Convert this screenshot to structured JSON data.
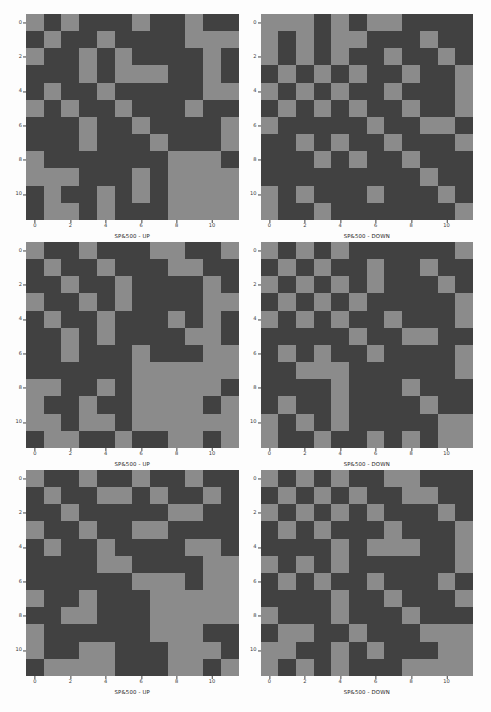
{
  "figure": {
    "columns": 2,
    "rows": 3,
    "background_color": "#fdfdfd",
    "on_color": "#8b8b8b",
    "off_color": "#414141",
    "grid_size": 12
  },
  "axes": {
    "x_ticks": [
      "0",
      "2",
      "4",
      "6",
      "8",
      "10"
    ],
    "y_ticks": [
      "0",
      "2",
      "4",
      "6",
      "8",
      "10"
    ],
    "tick_indices": [
      0,
      2,
      4,
      6,
      8,
      10
    ]
  },
  "chart_data": [
    {
      "type": "heatmap",
      "title": "SP&500 - UP",
      "xlabel": "",
      "ylabel": "",
      "xlim": [
        0,
        12
      ],
      "ylim": [
        0,
        12
      ],
      "grid": false,
      "legend": "none",
      "colorscale": [
        "#414141",
        "#8b8b8b"
      ],
      "x": [
        0,
        1,
        2,
        3,
        4,
        5,
        6,
        7,
        8,
        9,
        10,
        11
      ],
      "y": [
        0,
        1,
        2,
        3,
        4,
        5,
        6,
        7,
        8,
        9,
        10,
        11
      ],
      "values": [
        [
          1,
          0,
          1,
          0,
          0,
          0,
          1,
          0,
          0,
          1,
          0,
          0
        ],
        [
          0,
          1,
          0,
          0,
          1,
          0,
          0,
          0,
          0,
          1,
          1,
          1
        ],
        [
          1,
          0,
          0,
          1,
          0,
          1,
          0,
          0,
          0,
          0,
          1,
          0
        ],
        [
          0,
          0,
          0,
          1,
          0,
          1,
          1,
          1,
          0,
          0,
          1,
          0
        ],
        [
          0,
          1,
          0,
          0,
          1,
          0,
          0,
          0,
          0,
          0,
          1,
          1
        ],
        [
          1,
          0,
          1,
          0,
          0,
          1,
          0,
          0,
          0,
          1,
          0,
          0
        ],
        [
          0,
          0,
          0,
          1,
          0,
          0,
          1,
          0,
          0,
          0,
          0,
          1
        ],
        [
          0,
          0,
          0,
          1,
          0,
          0,
          0,
          1,
          0,
          0,
          0,
          1
        ],
        [
          1,
          0,
          0,
          0,
          0,
          0,
          0,
          0,
          1,
          1,
          1,
          0
        ],
        [
          1,
          1,
          1,
          0,
          0,
          0,
          1,
          0,
          1,
          1,
          1,
          1
        ],
        [
          0,
          1,
          0,
          0,
          1,
          0,
          1,
          0,
          1,
          1,
          1,
          1
        ],
        [
          0,
          1,
          1,
          0,
          1,
          0,
          0,
          0,
          1,
          1,
          1,
          1
        ]
      ]
    },
    {
      "type": "heatmap",
      "title": "SP&500 - DOWN",
      "xlabel": "",
      "ylabel": "",
      "xlim": [
        0,
        12
      ],
      "ylim": [
        0,
        12
      ],
      "grid": false,
      "legend": "none",
      "colorscale": [
        "#414141",
        "#8b8b8b"
      ],
      "x": [
        0,
        1,
        2,
        3,
        4,
        5,
        6,
        7,
        8,
        9,
        10,
        11
      ],
      "y": [
        0,
        1,
        2,
        3,
        4,
        5,
        6,
        7,
        8,
        9,
        10,
        11
      ],
      "values": [
        [
          1,
          1,
          1,
          0,
          1,
          0,
          1,
          1,
          0,
          0,
          0,
          0
        ],
        [
          1,
          0,
          1,
          0,
          1,
          1,
          0,
          0,
          0,
          1,
          0,
          0
        ],
        [
          1,
          0,
          1,
          0,
          1,
          0,
          0,
          1,
          0,
          0,
          1,
          0
        ],
        [
          0,
          1,
          0,
          1,
          0,
          1,
          0,
          0,
          1,
          0,
          0,
          1
        ],
        [
          1,
          0,
          1,
          0,
          1,
          0,
          0,
          1,
          0,
          0,
          0,
          1
        ],
        [
          0,
          1,
          0,
          1,
          0,
          1,
          0,
          0,
          1,
          0,
          0,
          1
        ],
        [
          1,
          0,
          0,
          0,
          0,
          0,
          1,
          0,
          0,
          1,
          1,
          0
        ],
        [
          0,
          0,
          1,
          0,
          1,
          0,
          0,
          1,
          0,
          0,
          0,
          1
        ],
        [
          0,
          0,
          0,
          1,
          0,
          1,
          0,
          0,
          1,
          0,
          0,
          0
        ],
        [
          0,
          0,
          0,
          0,
          0,
          0,
          0,
          0,
          0,
          1,
          0,
          0
        ],
        [
          1,
          0,
          1,
          0,
          0,
          0,
          1,
          0,
          0,
          0,
          1,
          0
        ],
        [
          1,
          0,
          0,
          1,
          0,
          0,
          0,
          0,
          0,
          0,
          0,
          1
        ]
      ]
    },
    {
      "type": "heatmap",
      "title": "SP&500 - UP",
      "xlabel": "",
      "ylabel": "",
      "xlim": [
        0,
        12
      ],
      "ylim": [
        0,
        12
      ],
      "grid": false,
      "legend": "none",
      "colorscale": [
        "#414141",
        "#8b8b8b"
      ],
      "x": [
        0,
        1,
        2,
        3,
        4,
        5,
        6,
        7,
        8,
        9,
        10,
        11
      ],
      "y": [
        0,
        1,
        2,
        3,
        4,
        5,
        6,
        7,
        8,
        9,
        10,
        11
      ],
      "values": [
        [
          1,
          0,
          0,
          1,
          0,
          0,
          0,
          1,
          1,
          0,
          0,
          1
        ],
        [
          0,
          1,
          0,
          0,
          1,
          0,
          0,
          0,
          1,
          1,
          0,
          0
        ],
        [
          0,
          0,
          1,
          0,
          0,
          1,
          0,
          0,
          0,
          0,
          1,
          0
        ],
        [
          1,
          0,
          0,
          1,
          0,
          1,
          0,
          0,
          0,
          0,
          1,
          1
        ],
        [
          0,
          1,
          0,
          0,
          1,
          0,
          0,
          0,
          1,
          0,
          1,
          0
        ],
        [
          0,
          0,
          1,
          0,
          1,
          0,
          0,
          0,
          0,
          1,
          1,
          0
        ],
        [
          0,
          0,
          1,
          0,
          0,
          0,
          1,
          0,
          0,
          0,
          1,
          1
        ],
        [
          0,
          0,
          0,
          0,
          0,
          0,
          1,
          1,
          1,
          1,
          1,
          1
        ],
        [
          1,
          1,
          0,
          0,
          1,
          0,
          1,
          1,
          1,
          1,
          1,
          0
        ],
        [
          1,
          0,
          0,
          1,
          0,
          0,
          1,
          1,
          1,
          1,
          0,
          1
        ],
        [
          1,
          1,
          0,
          1,
          1,
          0,
          1,
          1,
          1,
          1,
          1,
          1
        ],
        [
          0,
          1,
          1,
          0,
          0,
          1,
          0,
          0,
          1,
          1,
          0,
          1
        ]
      ]
    },
    {
      "type": "heatmap",
      "title": "SP&500 - DOWN",
      "xlabel": "",
      "ylabel": "",
      "xlim": [
        0,
        12
      ],
      "ylim": [
        0,
        12
      ],
      "grid": false,
      "legend": "none",
      "colorscale": [
        "#414141",
        "#8b8b8b"
      ],
      "x": [
        0,
        1,
        2,
        3,
        4,
        5,
        6,
        7,
        8,
        9,
        10,
        11
      ],
      "y": [
        0,
        1,
        2,
        3,
        4,
        5,
        6,
        7,
        8,
        9,
        10,
        11
      ],
      "values": [
        [
          1,
          0,
          1,
          0,
          1,
          0,
          0,
          0,
          0,
          0,
          0,
          1
        ],
        [
          0,
          1,
          0,
          1,
          0,
          0,
          1,
          0,
          0,
          1,
          0,
          0
        ],
        [
          1,
          0,
          1,
          0,
          1,
          0,
          1,
          0,
          0,
          0,
          1,
          0
        ],
        [
          0,
          1,
          0,
          1,
          0,
          1,
          0,
          0,
          0,
          0,
          0,
          1
        ],
        [
          1,
          0,
          1,
          0,
          1,
          0,
          0,
          1,
          0,
          0,
          0,
          1
        ],
        [
          0,
          0,
          0,
          0,
          0,
          1,
          0,
          0,
          1,
          1,
          0,
          0
        ],
        [
          0,
          1,
          0,
          1,
          0,
          0,
          1,
          0,
          0,
          0,
          0,
          1
        ],
        [
          0,
          0,
          1,
          1,
          1,
          0,
          0,
          0,
          0,
          0,
          0,
          1
        ],
        [
          0,
          0,
          0,
          0,
          1,
          0,
          0,
          0,
          1,
          0,
          0,
          0
        ],
        [
          0,
          1,
          0,
          0,
          1,
          0,
          0,
          0,
          0,
          1,
          0,
          0
        ],
        [
          1,
          0,
          1,
          0,
          1,
          0,
          0,
          0,
          0,
          0,
          1,
          1
        ],
        [
          1,
          0,
          0,
          1,
          0,
          0,
          1,
          0,
          1,
          0,
          1,
          1
        ]
      ]
    },
    {
      "type": "heatmap",
      "title": "SP&500 - UP",
      "xlabel": "",
      "ylabel": "",
      "xlim": [
        0,
        12
      ],
      "ylim": [
        0,
        12
      ],
      "grid": false,
      "legend": "none",
      "colorscale": [
        "#414141",
        "#8b8b8b"
      ],
      "x": [
        0,
        1,
        2,
        3,
        4,
        5,
        6,
        7,
        8,
        9,
        10,
        11
      ],
      "y": [
        0,
        1,
        2,
        3,
        4,
        5,
        6,
        7,
        8,
        9,
        10,
        11
      ],
      "values": [
        [
          1,
          0,
          0,
          1,
          0,
          0,
          1,
          0,
          0,
          1,
          0,
          0
        ],
        [
          0,
          1,
          0,
          0,
          1,
          1,
          0,
          1,
          0,
          0,
          1,
          0
        ],
        [
          0,
          0,
          1,
          0,
          0,
          0,
          0,
          0,
          1,
          1,
          0,
          0
        ],
        [
          1,
          0,
          0,
          1,
          0,
          0,
          1,
          1,
          0,
          0,
          0,
          0
        ],
        [
          0,
          1,
          0,
          0,
          1,
          0,
          0,
          0,
          0,
          1,
          1,
          0
        ],
        [
          0,
          0,
          0,
          0,
          1,
          1,
          0,
          0,
          0,
          0,
          1,
          1
        ],
        [
          0,
          0,
          0,
          0,
          0,
          0,
          1,
          1,
          1,
          0,
          1,
          1
        ],
        [
          1,
          0,
          0,
          1,
          0,
          0,
          0,
          1,
          1,
          1,
          1,
          1
        ],
        [
          0,
          0,
          1,
          1,
          0,
          0,
          0,
          1,
          1,
          1,
          1,
          1
        ],
        [
          1,
          0,
          0,
          0,
          0,
          0,
          0,
          1,
          1,
          1,
          0,
          0
        ],
        [
          1,
          0,
          0,
          1,
          1,
          0,
          0,
          0,
          1,
          1,
          1,
          0
        ],
        [
          0,
          1,
          1,
          1,
          1,
          0,
          0,
          0,
          1,
          1,
          0,
          1
        ]
      ]
    },
    {
      "type": "heatmap",
      "title": "SP&500 - DOWN",
      "xlabel": "",
      "ylabel": "",
      "xlim": [
        0,
        12
      ],
      "ylim": [
        0,
        12
      ],
      "grid": false,
      "legend": "none",
      "colorscale": [
        "#414141",
        "#8b8b8b"
      ],
      "x": [
        0,
        1,
        2,
        3,
        4,
        5,
        6,
        7,
        8,
        9,
        10,
        11
      ],
      "y": [
        0,
        1,
        2,
        3,
        4,
        5,
        6,
        7,
        8,
        9,
        10,
        11
      ],
      "values": [
        [
          1,
          0,
          1,
          0,
          1,
          0,
          0,
          1,
          1,
          0,
          0,
          0
        ],
        [
          0,
          1,
          0,
          1,
          0,
          1,
          0,
          0,
          1,
          1,
          0,
          0
        ],
        [
          1,
          0,
          1,
          0,
          1,
          0,
          1,
          0,
          0,
          0,
          1,
          0
        ],
        [
          0,
          1,
          0,
          1,
          0,
          0,
          0,
          1,
          0,
          0,
          0,
          1
        ],
        [
          0,
          0,
          0,
          0,
          1,
          0,
          1,
          1,
          1,
          0,
          0,
          1
        ],
        [
          1,
          0,
          1,
          0,
          1,
          0,
          0,
          0,
          0,
          0,
          0,
          1
        ],
        [
          0,
          1,
          0,
          1,
          0,
          0,
          1,
          0,
          0,
          0,
          1,
          0
        ],
        [
          0,
          0,
          0,
          0,
          1,
          0,
          0,
          1,
          0,
          0,
          0,
          1
        ],
        [
          1,
          0,
          0,
          0,
          1,
          0,
          0,
          0,
          1,
          0,
          0,
          0
        ],
        [
          0,
          1,
          1,
          0,
          0,
          1,
          0,
          0,
          0,
          1,
          1,
          1
        ],
        [
          1,
          1,
          0,
          0,
          1,
          0,
          1,
          0,
          0,
          0,
          1,
          1
        ],
        [
          1,
          0,
          1,
          0,
          1,
          0,
          0,
          0,
          1,
          1,
          1,
          1
        ]
      ]
    }
  ]
}
